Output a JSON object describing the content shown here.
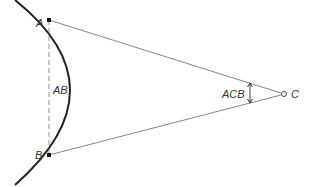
{
  "diagram": {
    "labels": {
      "point_a": "A",
      "point_b": "B",
      "point_c": "C",
      "chord": "AB",
      "angle": "ACB"
    },
    "colors": {
      "line": "#555555",
      "arc": "#222222",
      "background": "#ffffff"
    }
  }
}
